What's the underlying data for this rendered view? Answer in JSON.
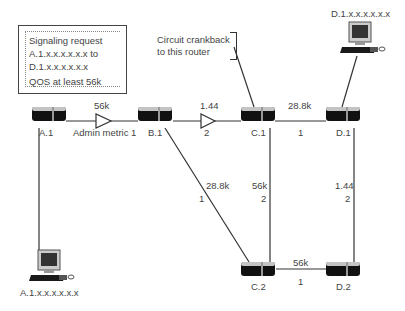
{
  "info_box": {
    "line1": "Signaling request",
    "line2": "A.1.x.x.x.x.x.x to",
    "line3": "D.1.x.x.x.x.x.x",
    "line4": "QOS at least 56k"
  },
  "callout": {
    "line1": "Circuit crankback",
    "line2": "to this router"
  },
  "routers": [
    {
      "id": "A.1",
      "label": "A.1"
    },
    {
      "id": "B.1",
      "label": "B.1"
    },
    {
      "id": "C.1",
      "label": "C.1"
    },
    {
      "id": "D.1",
      "label": "D.1"
    },
    {
      "id": "C.2",
      "label": "C.2"
    },
    {
      "id": "D.2",
      "label": "D.2"
    }
  ],
  "hosts": [
    {
      "id": "host-d1",
      "label": "D.1.x.x.x.x.x.x"
    },
    {
      "id": "host-a1",
      "label": "A.1.x.x.x.x.x.x"
    }
  ],
  "links": [
    {
      "from": "A.1",
      "to": "B.1",
      "bandwidth": "56k",
      "metric": "Admin metric 1"
    },
    {
      "from": "B.1",
      "to": "C.1",
      "bandwidth": "1.44",
      "metric": "2"
    },
    {
      "from": "C.1",
      "to": "D.1",
      "bandwidth": "28.8k",
      "metric": "1"
    },
    {
      "from": "B.1",
      "to": "C.2",
      "bandwidth": "28.8k",
      "metric": "1"
    },
    {
      "from": "C.1",
      "to": "C.2",
      "bandwidth": "56k",
      "metric": "2"
    },
    {
      "from": "D.1",
      "to": "D.2",
      "bandwidth": "1.44",
      "metric": "2"
    },
    {
      "from": "C.2",
      "to": "D.2",
      "bandwidth": "56k",
      "metric": "1"
    }
  ],
  "colors": {
    "line": "#333333",
    "router_body": "#111111",
    "router_top": "#bdbdbd",
    "text": "#444444"
  }
}
